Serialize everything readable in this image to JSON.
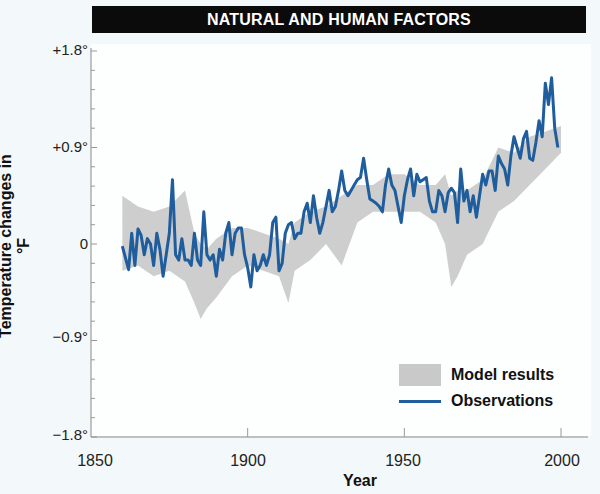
{
  "chart_data": {
    "type": "line",
    "title": "NATURAL AND HUMAN FACTORS",
    "xlabel": "Year",
    "ylabel": "Temperature changes in °F",
    "xlim": [
      1850,
      2005
    ],
    "ylim": [
      -1.8,
      1.8
    ],
    "x_ticks": [
      "1850",
      "1900",
      "1950",
      "2000"
    ],
    "y_ticks": [
      "+1.8°",
      "+0.9°",
      "0",
      "−0.9°",
      "−1.8°"
    ],
    "grid": false,
    "legend_position": "lower right",
    "legend": [
      "Model results",
      "Observations"
    ],
    "colors": {
      "observations": "#1f5d9d",
      "model_band": "#c9c9c9",
      "title_bg": "#0b0b0b",
      "page_bg": "#f3f8fa"
    },
    "series": [
      {
        "name": "Observations",
        "style": "line",
        "x": [
          1860,
          1862,
          1863,
          1864,
          1865,
          1866,
          1867,
          1868,
          1869,
          1870,
          1871,
          1872,
          1873,
          1874,
          1875,
          1876,
          1877,
          1878,
          1879,
          1880,
          1881,
          1882,
          1883,
          1884,
          1885,
          1886,
          1887,
          1888,
          1889,
          1890,
          1891,
          1892,
          1893,
          1894,
          1895,
          1896,
          1897,
          1898,
          1899,
          1900,
          1901,
          1902,
          1903,
          1904,
          1905,
          1906,
          1907,
          1908,
          1909,
          1910,
          1911,
          1912,
          1913,
          1914,
          1915,
          1916,
          1917,
          1918,
          1919,
          1920,
          1921,
          1922,
          1923,
          1924,
          1925,
          1926,
          1927,
          1928,
          1929,
          1930,
          1931,
          1932,
          1933,
          1934,
          1935,
          1936,
          1937,
          1938,
          1939,
          1940,
          1941,
          1942,
          1943,
          1944,
          1945,
          1946,
          1947,
          1948,
          1949,
          1950,
          1951,
          1952,
          1953,
          1954,
          1955,
          1956,
          1957,
          1958,
          1959,
          1960,
          1961,
          1962,
          1963,
          1964,
          1965,
          1966,
          1967,
          1968,
          1969,
          1970,
          1971,
          1972,
          1973,
          1974,
          1975,
          1976,
          1977,
          1978,
          1979,
          1980,
          1981,
          1982,
          1983,
          1984,
          1985,
          1986,
          1987,
          1988,
          1989,
          1990,
          1991,
          1992,
          1993,
          1994,
          1995,
          1996,
          1997,
          1998,
          1999
        ],
        "y": [
          -0.02,
          -0.24,
          0.1,
          -0.2,
          0.14,
          0.08,
          -0.1,
          0.05,
          0.0,
          -0.2,
          0.1,
          -0.05,
          -0.3,
          -0.1,
          0.1,
          0.6,
          -0.1,
          -0.15,
          0.05,
          -0.15,
          -0.15,
          -0.2,
          0.1,
          -0.15,
          -0.2,
          0.3,
          -0.1,
          -0.15,
          -0.1,
          -0.3,
          -0.05,
          -0.15,
          0.1,
          0.2,
          -0.1,
          0.1,
          0.15,
          0.15,
          -0.1,
          -0.22,
          -0.4,
          -0.1,
          -0.25,
          -0.2,
          -0.1,
          -0.2,
          -0.1,
          0.2,
          0.25,
          -0.25,
          -0.18,
          0.1,
          0.18,
          0.2,
          0.05,
          0.1,
          0.1,
          0.3,
          0.38,
          0.2,
          0.45,
          0.25,
          0.1,
          0.2,
          0.35,
          0.5,
          0.3,
          0.35,
          0.5,
          0.68,
          0.5,
          0.45,
          0.5,
          0.55,
          0.6,
          0.62,
          0.8,
          0.6,
          0.42,
          0.4,
          0.38,
          0.35,
          0.3,
          0.55,
          0.7,
          0.55,
          0.5,
          0.35,
          0.2,
          0.45,
          0.6,
          0.7,
          0.45,
          0.65,
          0.58,
          0.6,
          0.62,
          0.4,
          0.3,
          0.3,
          0.5,
          0.45,
          0.3,
          0.48,
          0.52,
          0.48,
          0.2,
          0.7,
          0.4,
          0.5,
          0.3,
          0.45,
          0.25,
          0.45,
          0.65,
          0.55,
          0.68,
          0.68,
          0.5,
          0.82,
          0.75,
          0.7,
          0.55,
          0.82,
          1.0,
          0.9,
          0.8,
          0.98,
          1.05,
          0.8,
          0.78,
          0.95,
          1.15,
          1.0,
          1.5,
          1.3,
          1.55,
          1.08,
          0.9
        ],
        "note": "Values approximate, read from plot (annual, °F anomaly)"
      },
      {
        "name": "Model results",
        "style": "band",
        "x": [
          1860,
          1865,
          1870,
          1875,
          1880,
          1883,
          1885,
          1887,
          1890,
          1895,
          1900,
          1905,
          1910,
          1913,
          1915,
          1920,
          1925,
          1930,
          1935,
          1940,
          1945,
          1950,
          1955,
          1960,
          1963,
          1965,
          1967,
          1970,
          1975,
          1980,
          1985,
          1990,
          1995,
          2000
        ],
        "lower": [
          -0.25,
          -0.2,
          -0.3,
          -0.25,
          -0.35,
          -0.55,
          -0.7,
          -0.6,
          -0.5,
          -0.3,
          -0.2,
          -0.25,
          -0.3,
          -0.55,
          -0.25,
          -0.15,
          0.0,
          -0.2,
          0.2,
          0.3,
          0.3,
          0.3,
          0.3,
          0.2,
          0.0,
          -0.4,
          -0.3,
          -0.1,
          0.0,
          0.3,
          0.4,
          0.55,
          0.7,
          0.85
        ],
        "upper": [
          0.45,
          0.35,
          0.3,
          0.35,
          0.5,
          0.1,
          0.0,
          -0.05,
          0.05,
          0.15,
          0.15,
          0.1,
          0.05,
          0.0,
          0.2,
          0.3,
          0.35,
          0.45,
          0.55,
          0.55,
          0.65,
          0.65,
          0.55,
          0.55,
          0.65,
          0.45,
          0.5,
          0.5,
          0.6,
          0.9,
          0.85,
          1.0,
          1.05,
          1.1
        ]
      }
    ]
  },
  "title_bar": {
    "text": "NATURAL AND HUMAN FACTORS"
  },
  "axes": {
    "ylabel": "Temperature changes in °F",
    "xlabel": "Year",
    "y_ticks": [
      "+1.8°",
      "+0.9°",
      "0",
      "−0.9°",
      "−1.8°"
    ],
    "x_ticks": [
      "1850",
      "1900",
      "1950",
      "2000"
    ]
  },
  "legend": {
    "model": "Model results",
    "observations": "Observations"
  }
}
